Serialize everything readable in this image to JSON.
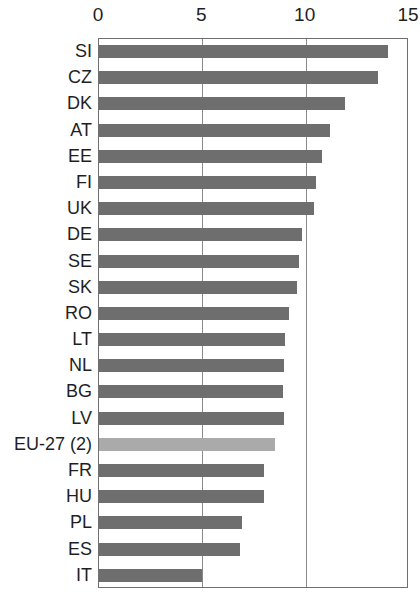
{
  "chart_data": {
    "type": "bar",
    "orientation": "horizontal",
    "title": "",
    "subtitle": "",
    "xlabel": "",
    "ylabel": "",
    "xlim": [
      0,
      15
    ],
    "ylim": null,
    "grid": "vertical gridlines at x = 5 and x = 10",
    "legend": null,
    "legend_position": "none",
    "axis_ticks": [
      "0",
      "5",
      "10",
      "15"
    ],
    "axis_tick_values": [
      0,
      5,
      10,
      15
    ],
    "gridline_values": [
      5,
      10
    ],
    "categories": [
      "SI",
      "CZ",
      "DK",
      "AT",
      "EE",
      "FI",
      "UK",
      "DE",
      "SE",
      "SK",
      "RO",
      "LT",
      "NL",
      "BG",
      "LV",
      "EU-27 (2)",
      "FR",
      "HU",
      "PL",
      "ES",
      "IT"
    ],
    "values": [
      14.0,
      13.5,
      11.9,
      11.2,
      10.8,
      10.5,
      10.4,
      9.8,
      9.7,
      9.6,
      9.2,
      9.0,
      8.95,
      8.9,
      8.95,
      8.5,
      8.0,
      8.0,
      6.9,
      6.8,
      5.0
    ],
    "highlight_category": "EU-27 (2)",
    "colors": {
      "bar": "#6e6e6e",
      "bar_highlight": "#aaaaaa",
      "frame": "#6f6f6f",
      "gridline": "#8a8a8a",
      "text": "#1f1f1f",
      "background": "#ffffff"
    },
    "bars": [
      {
        "label": "SI",
        "value": 14.0,
        "highlight": false
      },
      {
        "label": "CZ",
        "value": 13.5,
        "highlight": false
      },
      {
        "label": "DK",
        "value": 11.9,
        "highlight": false
      },
      {
        "label": "AT",
        "value": 11.2,
        "highlight": false
      },
      {
        "label": "EE",
        "value": 10.8,
        "highlight": false
      },
      {
        "label": "FI",
        "value": 10.5,
        "highlight": false
      },
      {
        "label": "UK",
        "value": 10.4,
        "highlight": false
      },
      {
        "label": "DE",
        "value": 9.8,
        "highlight": false
      },
      {
        "label": "SE",
        "value": 9.7,
        "highlight": false
      },
      {
        "label": "SK",
        "value": 9.6,
        "highlight": false
      },
      {
        "label": "RO",
        "value": 9.2,
        "highlight": false
      },
      {
        "label": "LT",
        "value": 9.0,
        "highlight": false
      },
      {
        "label": "NL",
        "value": 8.95,
        "highlight": false
      },
      {
        "label": "BG",
        "value": 8.9,
        "highlight": false
      },
      {
        "label": "LV",
        "value": 8.95,
        "highlight": false
      },
      {
        "label": "EU-27 (2)",
        "value": 8.5,
        "highlight": true
      },
      {
        "label": "FR",
        "value": 8.0,
        "highlight": false
      },
      {
        "label": "HU",
        "value": 8.0,
        "highlight": false
      },
      {
        "label": "PL",
        "value": 6.9,
        "highlight": false
      },
      {
        "label": "ES",
        "value": 6.8,
        "highlight": false
      },
      {
        "label": "IT",
        "value": 5.0,
        "highlight": false
      }
    ]
  }
}
